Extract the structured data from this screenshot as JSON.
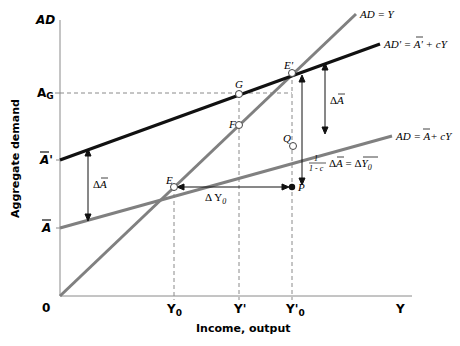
{
  "diagram": {
    "y_axis": {
      "label": "Aggregate demand",
      "top_label": "AD"
    },
    "x_axis": {
      "label": "Income, output",
      "end_label": "Y",
      "origin_label": "0"
    },
    "y_ticks": [
      {
        "id": "AG",
        "text": "A",
        "sub": "G"
      },
      {
        "id": "Abar_prime",
        "text": "A",
        "suffix": "'"
      },
      {
        "id": "Abar",
        "text": "A"
      }
    ],
    "x_ticks": [
      {
        "id": "Y0",
        "text": "Y",
        "sub": "0"
      },
      {
        "id": "Yprime",
        "text": "Y'"
      },
      {
        "id": "Yprime0",
        "text": "Y'",
        "sub": "0"
      }
    ],
    "lines": {
      "ad_eq_y": {
        "label": "AD = Y",
        "color": "#808080"
      },
      "ad_prime": {
        "label_pre": "AD' = ",
        "label_a": "A",
        "label_post": "' + cY",
        "color": "#111111"
      },
      "ad": {
        "label_pre": "AD = ",
        "label_a": "A",
        "label_post": "+ cY",
        "color": "#808080"
      }
    },
    "points": {
      "E": "E",
      "E_prime": "E'",
      "G": "G",
      "F": "F",
      "Q": "Q",
      "P": "P"
    },
    "annotations": {
      "delta_a_left": {
        "delta": "Δ",
        "a": "A"
      },
      "delta_a_right": {
        "delta": "Δ",
        "a": "A"
      },
      "delta_y0": {
        "text": "Δ Y",
        "sub": "0"
      },
      "multiplier": {
        "num": "1",
        "den": "1 - c",
        "delta": "Δ",
        "a": "A",
        "eq": " = Δ",
        "y": "Y",
        "sub": "0"
      }
    }
  }
}
